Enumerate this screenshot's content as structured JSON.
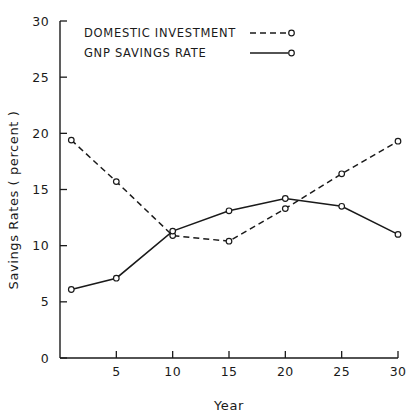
{
  "chart_data": {
    "type": "line",
    "title": "",
    "xlabel": "Year",
    "ylabel": "Savings Rates ( percent )",
    "xlim": [
      0,
      31
    ],
    "ylim": [
      0,
      30
    ],
    "xticks": [
      5,
      10,
      15,
      20,
      25,
      30
    ],
    "xtick_labels": [
      "5",
      "10",
      "15",
      "20",
      "25",
      "30"
    ],
    "yticks": [
      0,
      5,
      10,
      15,
      20,
      25,
      30
    ],
    "ytick_labels": [
      "0",
      "5",
      "10",
      "15",
      "20",
      "25",
      "30"
    ],
    "grid": false,
    "legend_position": "top-left",
    "x": [
      1,
      5,
      10,
      15,
      20,
      25,
      30
    ],
    "series": [
      {
        "name": "DOMESTIC INVESTMENT",
        "style": "dashed",
        "marker": "open-circle",
        "color": "#1a1a1a",
        "values": [
          19.4,
          15.7,
          10.9,
          10.4,
          13.3,
          16.4,
          19.3
        ]
      },
      {
        "name": "GNP SAVINGS RATE",
        "style": "solid",
        "marker": "open-circle",
        "color": "#1a1a1a",
        "values": [
          6.1,
          7.1,
          11.3,
          13.1,
          14.2,
          13.5,
          11.0
        ]
      }
    ]
  },
  "legend": {
    "entries": [
      {
        "label": "DOMESTIC INVESTMENT",
        "style": "dashed"
      },
      {
        "label": "GNP SAVINGS RATE",
        "style": "solid"
      }
    ]
  },
  "axes": {
    "x_title": "Year",
    "y_title": "Savings Rates ( percent )"
  },
  "colors": {
    "background": "#ffffff",
    "ink": "#1a1a1a"
  }
}
